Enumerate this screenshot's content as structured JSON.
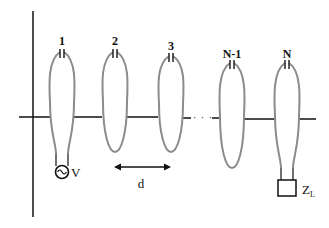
{
  "diagram": {
    "resonators": [
      {
        "label": "1"
      },
      {
        "label": "2"
      },
      {
        "label": "3"
      },
      {
        "label": "N-1"
      },
      {
        "label": "N"
      }
    ],
    "source_label": "V",
    "spacing_label": "d",
    "load_label_main": "Z",
    "load_label_sub": "L",
    "ellipsis": "· · ·",
    "colors": {
      "ring": "#8c8c8c",
      "wire": "#111111",
      "background": "#ffffff"
    }
  }
}
